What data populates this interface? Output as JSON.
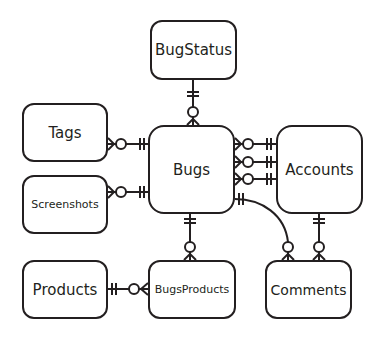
{
  "diagram": {
    "type": "entity-relationship",
    "entities": [
      {
        "id": "bugstatus",
        "label": "BugStatus"
      },
      {
        "id": "tags",
        "label": "Tags"
      },
      {
        "id": "screenshots",
        "label": "Screenshots"
      },
      {
        "id": "bugs",
        "label": "Bugs"
      },
      {
        "id": "accounts",
        "label": "Accounts"
      },
      {
        "id": "products",
        "label": "Products"
      },
      {
        "id": "bugsproducts",
        "label": "BugsProducts"
      },
      {
        "id": "comments",
        "label": "Comments"
      }
    ],
    "relationships": [
      {
        "from": "BugStatus",
        "to": "Bugs",
        "from_cardinality": "one",
        "to_cardinality": "zero-or-many"
      },
      {
        "from": "Bugs",
        "to": "Tags",
        "from_cardinality": "one",
        "to_cardinality": "zero-or-many"
      },
      {
        "from": "Bugs",
        "to": "Screenshots",
        "from_cardinality": "one",
        "to_cardinality": "zero-or-many"
      },
      {
        "from": "Accounts",
        "to": "Bugs",
        "from_cardinality": "one",
        "to_cardinality": "zero-or-many",
        "count": 3
      },
      {
        "from": "Bugs",
        "to": "Comments",
        "from_cardinality": "one",
        "to_cardinality": "zero-or-many"
      },
      {
        "from": "Accounts",
        "to": "Comments",
        "from_cardinality": "one",
        "to_cardinality": "zero-or-many"
      },
      {
        "from": "Bugs",
        "to": "BugsProducts",
        "from_cardinality": "one",
        "to_cardinality": "zero-or-many"
      },
      {
        "from": "Products",
        "to": "BugsProducts",
        "from_cardinality": "one",
        "to_cardinality": "zero-or-many"
      }
    ],
    "colors": {
      "stroke": "#231f20",
      "background": "#ffffff"
    }
  }
}
